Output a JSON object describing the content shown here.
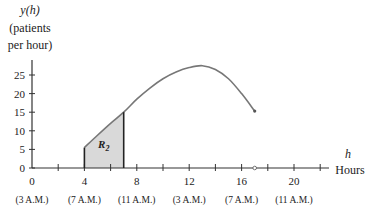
{
  "chart_data": {
    "type": "line",
    "title": "",
    "ylabel_var": "y(h)",
    "ylabel_line2": "(patients",
    "ylabel_line3": "per hour)",
    "xlabel_var": "h",
    "xlabel_unit": "Hours",
    "ylim": [
      0,
      28
    ],
    "xlim": [
      0,
      23
    ],
    "y_ticks": [
      0,
      5,
      10,
      15,
      20,
      25
    ],
    "x_ticks": [
      0,
      2,
      4,
      6,
      8,
      10,
      12,
      14,
      16,
      18,
      20,
      22
    ],
    "x_tick_labels": [
      {
        "value": 0,
        "label": "0",
        "time": "(3 A.M.)"
      },
      {
        "value": 4,
        "label": "4",
        "time": "(7 A.M.)"
      },
      {
        "value": 8,
        "label": "8",
        "time": "(11 A.M.)"
      },
      {
        "value": 12,
        "label": "12",
        "time": "(3 A.M.)"
      },
      {
        "value": 16,
        "label": "16",
        "time": "(7 A.M.)"
      },
      {
        "value": 20,
        "label": "20",
        "time": "(11 A.M.)"
      }
    ],
    "series": [
      {
        "name": "y(h)",
        "x": [
          4,
          5,
          6,
          7,
          8,
          9,
          10,
          11,
          12,
          13,
          14,
          15,
          16,
          17
        ],
        "y": [
          5.5,
          8.8,
          12,
          15,
          18.5,
          21.5,
          24,
          25.8,
          27,
          27.5,
          26.5,
          24,
          20,
          15.3
        ]
      }
    ],
    "shaded_region": {
      "label": "R",
      "subscript": "2",
      "from_h": 4,
      "to_h": 7
    },
    "open_point": {
      "h": 17,
      "y": 0
    },
    "grid": false,
    "legend": "none"
  }
}
